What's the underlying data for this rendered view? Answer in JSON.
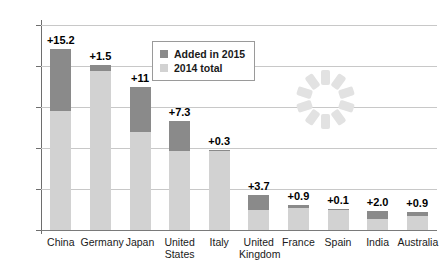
{
  "chart_data": {
    "type": "bar",
    "stacked": true,
    "title": "",
    "subtitle": "",
    "xlabel": "",
    "ylabel": "",
    "ylim": [
      0,
      50
    ],
    "yticks": [
      0,
      10,
      20,
      30,
      40,
      50
    ],
    "grid": true,
    "legend_position": "top-center",
    "categories": [
      "China",
      "Germany",
      "Japan",
      "United States",
      "Italy",
      "United Kingdom",
      "France",
      "Spain",
      "India",
      "Australia"
    ],
    "series": [
      {
        "name": "2014 total",
        "color": "#d2d2d2",
        "values": [
          29.0,
          38.8,
          24.0,
          19.2,
          19.2,
          4.9,
          5.3,
          5.0,
          2.6,
          3.4
        ]
      },
      {
        "name": "Added in 2015",
        "color": "#8a8a8a",
        "values": [
          15.2,
          1.5,
          11.0,
          7.3,
          0.3,
          3.7,
          0.9,
          0.1,
          2.0,
          0.9
        ]
      }
    ],
    "totals": [
      44.2,
      40.3,
      35.0,
      26.5,
      19.5,
      8.6,
      6.2,
      5.1,
      4.6,
      4.3
    ],
    "data_labels": [
      "+15.2",
      "+1.5",
      "+11",
      "+7.3",
      "+0.3",
      "+3.7",
      "+0.9",
      "+0.1",
      "+2.0",
      "+0.9"
    ]
  },
  "legend": {
    "items": [
      {
        "label": "Added in 2015",
        "color": "#8a8a8a"
      },
      {
        "label": "2014 total",
        "color": "#d2d2d2"
      }
    ]
  },
  "axis": {
    "y_tick_labels": [
      "0",
      "10",
      "20",
      "30",
      "40",
      "50"
    ]
  },
  "watermark": {
    "name": "loading-spinner-watermark",
    "blade_count": 10,
    "color": "#e2e2e2"
  }
}
